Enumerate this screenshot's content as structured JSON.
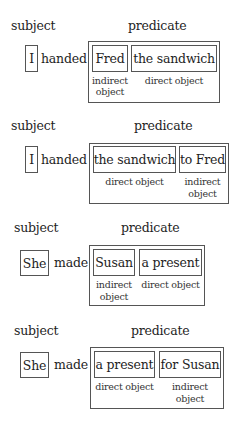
{
  "diagrams": [
    {
      "subject_label": "subject",
      "predicate_label": "predicate",
      "subject": "I",
      "verb": "handed",
      "objects": [
        {
          "text": "Fred",
          "role": "indirect object",
          "role_line1": "indirect",
          "role_line2": "object"
        },
        {
          "text": "the sandwich",
          "role": "direct object",
          "role_line1": "direct object",
          "role_line2": ""
        }
      ]
    },
    {
      "subject_label": "subject",
      "predicate_label": "predicate",
      "subject": "I",
      "verb": "handed",
      "objects": [
        {
          "text": "the sandwich",
          "role": "direct object",
          "role_line1": "direct object",
          "role_line2": ""
        },
        {
          "text": "to Fred",
          "role": "indirect object",
          "role_line1": "indirect",
          "role_line2": "object"
        }
      ]
    },
    {
      "subject_label": "subject",
      "predicate_label": "predicate",
      "subject": "She",
      "verb": "made",
      "objects": [
        {
          "text": "Susan",
          "role": "indirect object",
          "role_line1": "indirect",
          "role_line2": "object"
        },
        {
          "text": "a present",
          "role": "direct object",
          "role_line1": "direct object",
          "role_line2": ""
        }
      ]
    },
    {
      "subject_label": "subject",
      "predicate_label": "predicate",
      "subject": "She",
      "verb": "made",
      "objects": [
        {
          "text": "a present",
          "role": "direct object",
          "role_line1": "direct object",
          "role_line2": ""
        },
        {
          "text": "for Susan",
          "role": "indirect object",
          "role_line1": "indirect",
          "role_line2": "object"
        }
      ]
    }
  ]
}
